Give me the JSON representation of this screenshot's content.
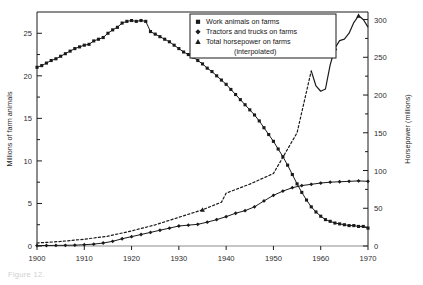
{
  "figure": {
    "caption": "Figure 12.",
    "background": "#ffffff",
    "ink": "#1a1a1a"
  },
  "chart_data": {
    "type": "line",
    "title": "",
    "xlabel": "",
    "ylabel": "Millions of farm animals",
    "y2label": "Horsepower (millions)",
    "grid": false,
    "legend_position": "top-right",
    "xlim": [
      1900,
      1970
    ],
    "ylim": [
      0,
      27.5
    ],
    "y2lim": [
      0,
      310
    ],
    "xticks": [
      1900,
      1910,
      1920,
      1930,
      1940,
      1950,
      1960,
      1970
    ],
    "xticklabels": [
      "1900",
      "1910",
      "1920",
      "1930",
      "1940",
      "1950",
      "1960",
      "1970"
    ],
    "yticks": [
      0,
      5,
      10,
      15,
      20,
      25
    ],
    "yticklabels": [
      "0",
      "5",
      "10",
      "15",
      "20",
      "25"
    ],
    "y2ticks": [
      0,
      50,
      100,
      150,
      200,
      250,
      300
    ],
    "y2ticklabels": [
      "0",
      "50",
      "100",
      "150",
      "200",
      "250",
      "300"
    ],
    "series": [
      {
        "name": "Work animals on farms",
        "marker": "square",
        "axis": "left",
        "linestyle": "solid",
        "x": [
          1900,
          1901,
          1902,
          1903,
          1904,
          1905,
          1906,
          1907,
          1908,
          1909,
          1910,
          1911,
          1912,
          1913,
          1914,
          1915,
          1916,
          1917,
          1918,
          1919,
          1920,
          1921,
          1922,
          1923,
          1924,
          1925,
          1926,
          1927,
          1928,
          1929,
          1930,
          1931,
          1932,
          1933,
          1934,
          1935,
          1936,
          1937,
          1938,
          1939,
          1940,
          1941,
          1942,
          1943,
          1944,
          1945,
          1946,
          1947,
          1948,
          1949,
          1950,
          1951,
          1952,
          1953,
          1954,
          1955,
          1956,
          1957,
          1958,
          1959,
          1960,
          1961,
          1962,
          1963,
          1964,
          1965,
          1966,
          1967,
          1968,
          1969,
          1970
        ],
        "y": [
          21.0,
          21.2,
          21.5,
          21.8,
          22.0,
          22.3,
          22.6,
          22.9,
          23.2,
          23.4,
          23.6,
          23.7,
          24.1,
          24.3,
          24.5,
          25.0,
          25.4,
          25.7,
          26.2,
          26.4,
          26.5,
          26.4,
          26.5,
          26.4,
          25.2,
          24.9,
          24.6,
          24.3,
          24.0,
          23.6,
          23.2,
          22.8,
          22.5,
          22.2,
          21.8,
          21.4,
          20.9,
          20.5,
          20.0,
          19.5,
          19.0,
          18.4,
          17.8,
          17.2,
          16.6,
          16.0,
          15.4,
          14.7,
          13.9,
          13.1,
          12.3,
          11.4,
          10.5,
          9.5,
          8.4,
          7.3,
          6.3,
          5.4,
          4.6,
          4.0,
          3.5,
          3.1,
          2.9,
          2.7,
          2.6,
          2.5,
          2.4,
          2.4,
          2.3,
          2.3,
          2.1
        ]
      },
      {
        "name": "Tractors and trucks on farms",
        "marker": "diamond",
        "axis": "left",
        "linestyle": "solid",
        "x": [
          1900,
          1902,
          1904,
          1906,
          1908,
          1910,
          1912,
          1914,
          1916,
          1918,
          1920,
          1922,
          1924,
          1926,
          1928,
          1930,
          1932,
          1934,
          1936,
          1938,
          1940,
          1942,
          1944,
          1946,
          1948,
          1950,
          1952,
          1954,
          1956,
          1958,
          1960,
          1962,
          1964,
          1966,
          1968,
          1970
        ],
        "y": [
          0.05,
          0.06,
          0.07,
          0.08,
          0.1,
          0.15,
          0.22,
          0.35,
          0.55,
          0.85,
          1.1,
          1.35,
          1.6,
          1.85,
          2.1,
          2.35,
          2.45,
          2.55,
          2.8,
          3.1,
          3.45,
          3.85,
          4.15,
          4.6,
          5.3,
          5.95,
          6.45,
          6.85,
          7.1,
          7.25,
          7.4,
          7.5,
          7.55,
          7.6,
          7.65,
          7.6
        ]
      },
      {
        "name": "Total horsepower on farms (interpolated)",
        "marker": "triangle",
        "axis": "right",
        "linestyle": "dotted-then-solid",
        "x": [
          1900,
          1905,
          1910,
          1915,
          1920,
          1925,
          1930,
          1935,
          1939,
          1940,
          1945,
          1950,
          1955,
          1958,
          1959,
          1960,
          1961,
          1962,
          1963,
          1964,
          1965,
          1966,
          1967,
          1968,
          1969,
          1970
        ],
        "y": [
          4,
          6,
          9,
          13,
          20,
          28,
          38,
          48,
          58,
          70,
          82,
          96,
          150,
          232,
          212,
          205,
          208,
          240,
          262,
          272,
          274,
          282,
          296,
          305,
          300,
          290
        ],
        "dotted_until_year": 1958
      }
    ],
    "legend_entries": [
      "Work animals on farms",
      "Tractors and trucks on farms",
      "Total horsepower on farms",
      "(interpolated)"
    ]
  }
}
